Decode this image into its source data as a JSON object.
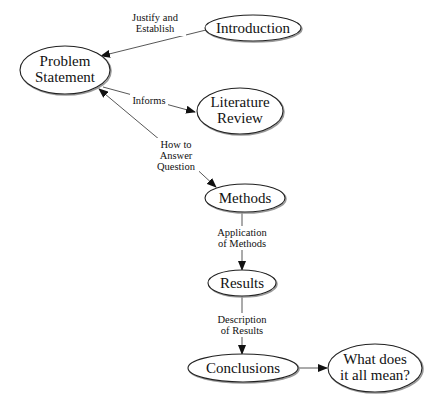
{
  "diagram": {
    "title": "",
    "nodes": [
      {
        "id": "introduction",
        "lines": [
          "Introduction"
        ],
        "cx": 253,
        "cy": 28,
        "rx": 48,
        "ry": 13
      },
      {
        "id": "problem_statement",
        "lines": [
          "Problem",
          "Statement"
        ],
        "cx": 65,
        "cy": 70,
        "rx": 45,
        "ry": 24
      },
      {
        "id": "literature_review",
        "lines": [
          "Literature",
          "Review"
        ],
        "cx": 240,
        "cy": 111,
        "rx": 43,
        "ry": 23
      },
      {
        "id": "methods",
        "lines": [
          "Methods"
        ],
        "cx": 245,
        "cy": 198,
        "rx": 40,
        "ry": 14
      },
      {
        "id": "results",
        "lines": [
          "Results"
        ],
        "cx": 242,
        "cy": 283,
        "rx": 34,
        "ry": 13
      },
      {
        "id": "conclusions",
        "lines": [
          "Conclusions"
        ],
        "cx": 243,
        "cy": 368,
        "rx": 55,
        "ry": 14
      },
      {
        "id": "meaning",
        "lines": [
          "What does",
          "it all mean?"
        ],
        "cx": 375,
        "cy": 368,
        "rx": 47,
        "ry": 24
      }
    ],
    "edges": [
      {
        "from": "introduction",
        "to": "problem_statement",
        "label_lines": [
          "Justify and",
          "Establish"
        ],
        "lx": 155,
        "ly": 40
      },
      {
        "from": "problem_statement",
        "to": "literature_review",
        "label_lines": [
          "Informs"
        ],
        "lx": 148,
        "ly": 101
      },
      {
        "from": "literature_review",
        "to": "problem_statement",
        "label_lines": [],
        "lx": 0,
        "ly": 0
      },
      {
        "from": "problem_statement",
        "to": "methods",
        "label_lines": [
          "How to",
          "Answer",
          "Question"
        ],
        "lx": 175,
        "ly": 145
      },
      {
        "from": "methods",
        "to": "results",
        "label_lines": [
          "Application",
          "of Methods"
        ],
        "lx": 242,
        "ly": 237
      },
      {
        "from": "results",
        "to": "conclusions",
        "label_lines": [
          "Description",
          "of Results"
        ],
        "lx": 242,
        "ly": 322
      },
      {
        "from": "conclusions",
        "to": "meaning",
        "label_lines": [],
        "lx": 0,
        "ly": 0
      }
    ]
  }
}
